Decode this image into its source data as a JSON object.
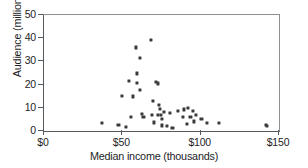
{
  "chart_data": {
    "type": "scatter",
    "title": "",
    "xlabel": "Median income (thousands)",
    "ylabel": "Audience (millions)",
    "xlim": [
      0,
      150
    ],
    "ylim": [
      0,
      50
    ],
    "xticks": [
      0,
      50,
      100,
      150
    ],
    "xtick_labels": [
      "$0",
      "$50",
      "$100",
      "$150"
    ],
    "yticks": [
      0,
      10,
      20,
      30,
      40,
      50
    ],
    "ytick_labels": [
      "0",
      "10",
      "20",
      "30",
      "40",
      "50"
    ],
    "grid": false,
    "legend": false,
    "marker_color": "#3a3a3c",
    "axis_color": "#555a5e",
    "background": "#ffffff",
    "series": [
      {
        "name": "markets",
        "points": [
          [
            37.0,
            3.4
          ],
          [
            47.5,
            2.6
          ],
          [
            50.0,
            15.0
          ],
          [
            52.5,
            1.6
          ],
          [
            54.5,
            21.5
          ],
          [
            55.5,
            6.2
          ],
          [
            56.5,
            14.9
          ],
          [
            58.5,
            36.0
          ],
          [
            59.5,
            20.7
          ],
          [
            59.5,
            24.8
          ],
          [
            61.0,
            31.5
          ],
          [
            61.5,
            17.5
          ],
          [
            62.5,
            7.4
          ],
          [
            63.5,
            6.1
          ],
          [
            68.0,
            39.2
          ],
          [
            69.0,
            7.1
          ],
          [
            69.5,
            13.0
          ],
          [
            70.0,
            3.7
          ],
          [
            71.5,
            21.2
          ],
          [
            72.5,
            20.5
          ],
          [
            73.0,
            7.0
          ],
          [
            73.5,
            11.4
          ],
          [
            74.0,
            9.5
          ],
          [
            74.5,
            6.9
          ],
          [
            75.0,
            5.0
          ],
          [
            75.5,
            2.4
          ],
          [
            76.5,
            8.3
          ],
          [
            78.5,
            2.1
          ],
          [
            80.5,
            7.6
          ],
          [
            82.0,
            1.2
          ],
          [
            85.5,
            8.7
          ],
          [
            88.5,
            5.9
          ],
          [
            89.5,
            9.3
          ],
          [
            91.0,
            3.1
          ],
          [
            92.0,
            9.9
          ],
          [
            93.5,
            5.9
          ],
          [
            95.0,
            8.6
          ],
          [
            96.0,
            4.1
          ],
          [
            97.0,
            6.8
          ],
          [
            100.5,
            5.2
          ],
          [
            104.0,
            3.4
          ],
          [
            111.5,
            3.3
          ],
          [
            141.5,
            2.6
          ],
          [
            142.5,
            2.1
          ]
        ]
      }
    ]
  }
}
